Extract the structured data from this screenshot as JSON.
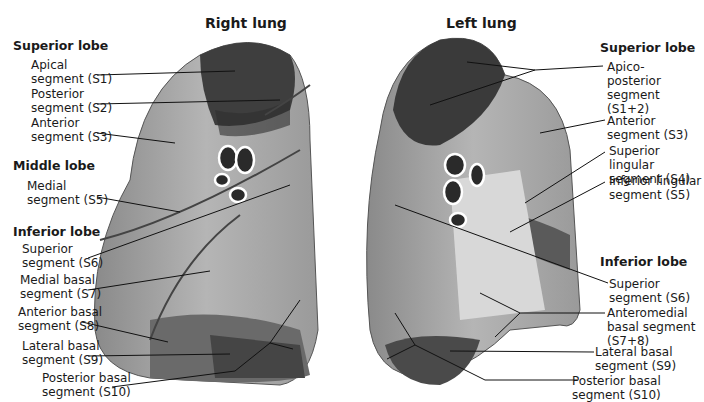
{
  "right_lung": {
    "title": "Right lung",
    "superior_lobe": "Superior lobe",
    "middle_lobe": "Middle lobe",
    "inferior_lobe": "Inferior lobe",
    "labels": [
      {
        "l1": "Apical",
        "l2": "segment (S1)"
      },
      {
        "l1": "Posterior",
        "l2": "segment (S2)"
      },
      {
        "l1": "Anterior",
        "l2": "segment (S3)"
      },
      {
        "l1": "Medial",
        "l2": "segment (S5)"
      },
      {
        "l1": "Superior",
        "l2": "segment (S6)"
      },
      {
        "l1": "Medial basal",
        "l2": "segment (S7)"
      },
      {
        "l1": "Anterior basal",
        "l2": "segment (S8)"
      },
      {
        "l1": "Lateral basal",
        "l2": "segment (S9)"
      },
      {
        "l1": "Posterior basal",
        "l2": "segment (S10)"
      }
    ]
  },
  "left_lung": {
    "title": "Left lung",
    "superior_lobe": "Superior lobe",
    "inferior_lobe": "Inferior lobe",
    "labels": [
      {
        "l1": "Apico-",
        "l2": "posterior",
        "l3": "segment",
        "l4": "(S1+2)"
      },
      {
        "l1": "Anterior",
        "l2": "segment (S3)"
      },
      {
        "l1": "Superior lingular",
        "l2": "segment (S4)"
      },
      {
        "l1": "Inferior lingular",
        "l2": "segment (S5)"
      },
      {
        "l1": "Superior",
        "l2": "segment (S6)"
      },
      {
        "l1": "Anteromedial",
        "l2": "basal segment",
        "l3": "(S7+8)"
      },
      {
        "l1": "Lateral basal",
        "l2": "segment (S9)"
      },
      {
        "l1": "Posterior basal",
        "l2": "segment (S10)"
      }
    ]
  }
}
